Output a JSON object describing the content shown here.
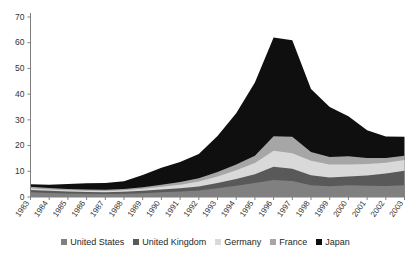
{
  "chart_data": {
    "type": "area",
    "stacked": true,
    "title": "",
    "subtitle": "",
    "xlabel": "",
    "ylabel": "",
    "grid": false,
    "legend_position": "bottom",
    "xlim": [
      1983,
      2003
    ],
    "ylim": [
      0,
      70
    ],
    "yticks": [
      0,
      10,
      20,
      30,
      40,
      50,
      60,
      70
    ],
    "categories": [
      "1983",
      "1984",
      "1985",
      "1986",
      "1987",
      "1988",
      "1989",
      "1990",
      "1991",
      "1992",
      "1993",
      "1994",
      "1995",
      "1996",
      "1997",
      "1998",
      "1999",
      "2000",
      "2001",
      "2002",
      "2003"
    ],
    "series": [
      {
        "name": "United States",
        "color": "#808080",
        "values": [
          1.8,
          1.6,
          1.4,
          1.3,
          1.2,
          1.3,
          1.5,
          1.8,
          2.1,
          2.5,
          3.4,
          4.4,
          5.4,
          6.6,
          6.2,
          4.6,
          4.2,
          4.6,
          4.4,
          4.3,
          4.6
        ]
      },
      {
        "name": "United Kingdom",
        "color": "#595959",
        "values": [
          0.9,
          0.8,
          0.7,
          0.6,
          0.6,
          0.7,
          0.9,
          1.1,
          1.3,
          1.6,
          2.0,
          2.6,
          3.4,
          5.2,
          4.8,
          3.9,
          3.4,
          3.4,
          4.0,
          4.8,
          5.6
        ]
      },
      {
        "name": "Germany",
        "color": "#d9d9d9",
        "values": [
          0.6,
          0.5,
          0.5,
          0.5,
          0.5,
          0.6,
          0.8,
          1.1,
          1.4,
          1.9,
          2.6,
          3.4,
          4.4,
          6.2,
          6.0,
          5.6,
          5.0,
          4.6,
          4.4,
          4.2,
          4.2
        ]
      },
      {
        "name": "France",
        "color": "#a6a6a6",
        "values": [
          0.7,
          0.6,
          0.5,
          0.5,
          0.5,
          0.5,
          0.6,
          0.8,
          1.0,
          1.3,
          1.7,
          2.2,
          2.8,
          5.6,
          6.4,
          3.4,
          3.0,
          3.2,
          2.4,
          1.9,
          1.6
        ]
      },
      {
        "name": "Japan",
        "color": "#0f0f0f",
        "values": [
          1.0,
          1.3,
          2.0,
          2.4,
          2.6,
          3.0,
          4.8,
          6.6,
          7.8,
          9.4,
          14.0,
          20.0,
          28.5,
          38.4,
          37.6,
          24.5,
          19.4,
          15.6,
          10.8,
          8.3,
          7.4
        ]
      }
    ],
    "stack_totals": [
      5.0,
      4.8,
      5.1,
      5.3,
      5.4,
      6.1,
      8.6,
      11.4,
      13.6,
      16.7,
      23.7,
      32.6,
      44.5,
      62.0,
      61.0,
      42.0,
      35.0,
      31.4,
      26.0,
      23.5,
      23.4
    ]
  },
  "legend": {
    "items": [
      {
        "label": "United States",
        "color": "#808080"
      },
      {
        "label": "United Kingdom",
        "color": "#595959"
      },
      {
        "label": "Germany",
        "color": "#d9d9d9"
      },
      {
        "label": "France",
        "color": "#a6a6a6"
      },
      {
        "label": "Japan",
        "color": "#0f0f0f"
      }
    ]
  },
  "axes": {
    "y_tick_labels": [
      "70",
      "60",
      "50",
      "40",
      "30",
      "20",
      "10",
      "0"
    ],
    "x_tick_labels": [
      "1983",
      "1984",
      "1985",
      "1986",
      "1987",
      "1988",
      "1989",
      "1990",
      "1991",
      "1992",
      "1993",
      "1994",
      "1995",
      "1996",
      "1997",
      "1998",
      "1999",
      "2000",
      "2001",
      "2002",
      "2003"
    ]
  }
}
